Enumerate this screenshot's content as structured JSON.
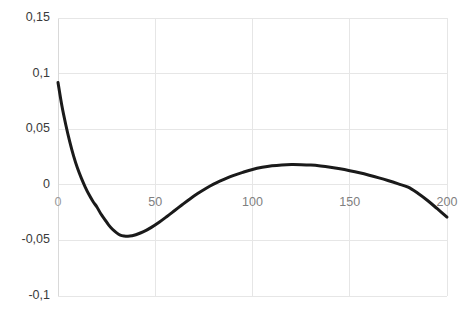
{
  "chart_data": {
    "type": "line",
    "title": "",
    "xlabel": "",
    "ylabel": "",
    "xlim": [
      0,
      200
    ],
    "ylim": [
      -0.1,
      0.15
    ],
    "grid": true,
    "legend": null,
    "y_ticks": [
      "0,15",
      "0,1",
      "0,05",
      "0",
      "-0,05",
      "-0,1"
    ],
    "y_tick_values": [
      0.15,
      0.1,
      0.05,
      0,
      -0.05,
      -0.1
    ],
    "x_ticks": [
      "0",
      "50",
      "100",
      "150",
      "200"
    ],
    "x_tick_values": [
      0,
      50,
      100,
      150,
      200
    ],
    "series": [
      {
        "name": "curve",
        "color": "#1a1a1a",
        "x": [
          0,
          2,
          4,
          6,
          8,
          10,
          12,
          14,
          16,
          18,
          20,
          22,
          24,
          26,
          28,
          30,
          32,
          34,
          36,
          38,
          40,
          44,
          48,
          52,
          56,
          60,
          64,
          68,
          72,
          76,
          80,
          85,
          90,
          95,
          100,
          105,
          110,
          115,
          120,
          125,
          130,
          135,
          140,
          145,
          150,
          155,
          160,
          165,
          170,
          175,
          180,
          185,
          190,
          195,
          200
        ],
        "y": [
          0.092,
          0.071,
          0.054,
          0.039,
          0.026,
          0.015,
          0.006,
          -0.002,
          -0.009,
          -0.015,
          -0.02,
          -0.026,
          -0.031,
          -0.036,
          -0.04,
          -0.043,
          -0.0452,
          -0.046,
          -0.0462,
          -0.0458,
          -0.0449,
          -0.0422,
          -0.0383,
          -0.0337,
          -0.0285,
          -0.0231,
          -0.0177,
          -0.0125,
          -0.0077,
          -0.0033,
          0.0006,
          0.0046,
          0.0083,
          0.0112,
          0.0138,
          0.0157,
          0.0171,
          0.0179,
          0.0182,
          0.0181,
          0.0177,
          0.0169,
          0.0158,
          0.0144,
          0.0127,
          0.0108,
          0.0086,
          0.0062,
          0.0036,
          0.0008,
          -0.0021,
          -0.0076,
          -0.0141,
          -0.0215,
          -0.029
        ]
      }
    ]
  },
  "geometry": {
    "plot_left": 58,
    "plot_right": 447,
    "plot_top": 18,
    "plot_bottom": 296
  }
}
